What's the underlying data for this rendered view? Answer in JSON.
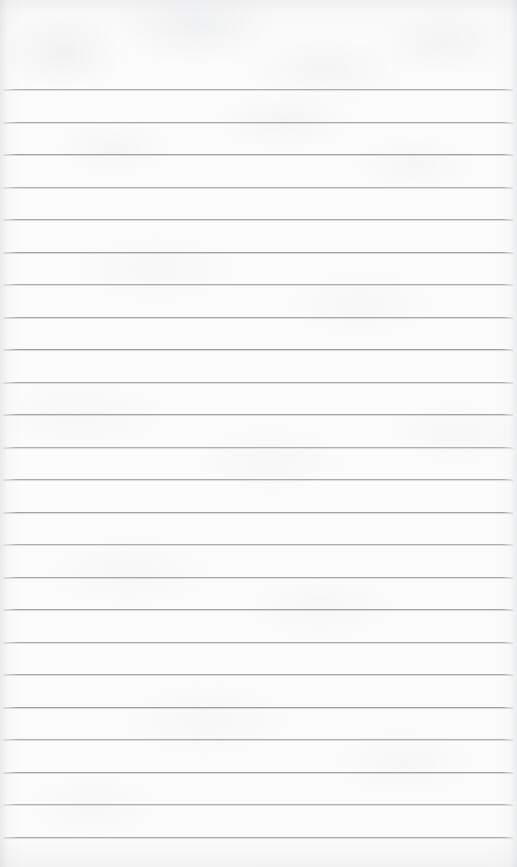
{
  "document": {
    "kind": "scanned-lined-notebook-page",
    "title": "Blank Lined Paper",
    "content_text": "",
    "width_px": 517,
    "height_px": 867
  },
  "paper": {
    "background_color": "#fcfcfc",
    "edge_shadow_color": "#bec1c6",
    "texture_color": "#ced1d6"
  },
  "ruling": {
    "line_color": "#9ba0a6",
    "line_thickness_px": 1,
    "line_spacing_px": 32.5,
    "first_line_y_px": 89,
    "line_start_x_px": 3,
    "line_end_x_px": 513,
    "line_count": 24,
    "top_margin_px": 89,
    "bottom_margin_px": 24,
    "lines_y_px": [
      89,
      121.5,
      154,
      186.5,
      219,
      251.5,
      284,
      316.5,
      349,
      381.5,
      414,
      446.5,
      479,
      511.5,
      544,
      576.5,
      609,
      641.5,
      674,
      706.5,
      739,
      771.5,
      804,
      836.5
    ]
  },
  "writing_areas": {
    "header_zone_label": "",
    "lines": [
      {
        "index": 1,
        "text": ""
      },
      {
        "index": 2,
        "text": ""
      },
      {
        "index": 3,
        "text": ""
      },
      {
        "index": 4,
        "text": ""
      },
      {
        "index": 5,
        "text": ""
      },
      {
        "index": 6,
        "text": ""
      },
      {
        "index": 7,
        "text": ""
      },
      {
        "index": 8,
        "text": ""
      },
      {
        "index": 9,
        "text": ""
      },
      {
        "index": 10,
        "text": ""
      },
      {
        "index": 11,
        "text": ""
      },
      {
        "index": 12,
        "text": ""
      },
      {
        "index": 13,
        "text": ""
      },
      {
        "index": 14,
        "text": ""
      },
      {
        "index": 15,
        "text": ""
      },
      {
        "index": 16,
        "text": ""
      },
      {
        "index": 17,
        "text": ""
      },
      {
        "index": 18,
        "text": ""
      },
      {
        "index": 19,
        "text": ""
      },
      {
        "index": 20,
        "text": ""
      },
      {
        "index": 21,
        "text": ""
      },
      {
        "index": 22,
        "text": ""
      },
      {
        "index": 23,
        "text": ""
      },
      {
        "index": 24,
        "text": ""
      }
    ]
  }
}
